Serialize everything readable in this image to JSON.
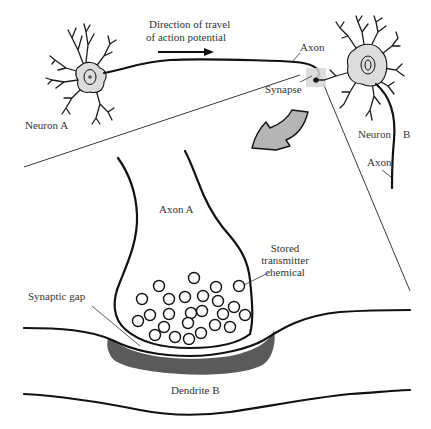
{
  "figure": {
    "type": "neuron-synapse-diagram",
    "colors": {
      "ink": "#111111",
      "label": "#333333",
      "soma_fill": "#dcdcdc",
      "arrow_fill": "#b5b5b5",
      "postsynaptic_density": "#5a5a5a",
      "synapse_highlight": "#d6d6d6"
    }
  },
  "labels": {
    "direction_line1": "Direction of travel",
    "direction_line2": "of action potential",
    "neuron_a": "Neuron A",
    "axon_top": "Axon",
    "synapse": "Synapse",
    "neuron_b": "Neuron",
    "neuron_b_letter": "B",
    "axon_b": "Axon",
    "axon_a": "Axon A",
    "stored_line1": "Stored",
    "stored_line2": "transmitter",
    "stored_line3": "chemical",
    "synaptic_gap": "Synaptic gap",
    "dendrite_b": "Dendrite B"
  },
  "vesicles": [
    [
      194,
      278
    ],
    [
      159,
      286
    ],
    [
      216,
      287
    ],
    [
      239,
      286
    ],
    [
      142,
      299
    ],
    [
      169,
      299
    ],
    [
      185,
      297
    ],
    [
      203,
      296
    ],
    [
      218,
      301
    ],
    [
      150,
      315
    ],
    [
      169,
      314
    ],
    [
      191,
      313
    ],
    [
      202,
      311
    ],
    [
      223,
      314
    ],
    [
      234,
      307
    ],
    [
      245,
      315
    ],
    [
      138,
      321
    ],
    [
      164,
      327
    ],
    [
      188,
      323
    ],
    [
      215,
      325
    ],
    [
      230,
      327
    ],
    [
      155,
      335
    ],
    [
      175,
      337
    ],
    [
      189,
      339
    ],
    [
      201,
      333
    ]
  ],
  "vesicle_radius": 5.5
}
